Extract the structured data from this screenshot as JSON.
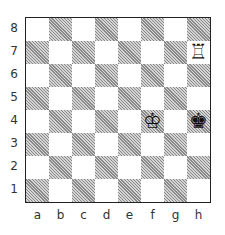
{
  "board": {
    "ranks": [
      "8",
      "7",
      "6",
      "5",
      "4",
      "3",
      "2",
      "1"
    ],
    "files": [
      "a",
      "b",
      "c",
      "d",
      "e",
      "f",
      "g",
      "h"
    ],
    "pieces": [
      {
        "square": "h7",
        "piece": "white-rook",
        "glyph": "♖"
      },
      {
        "square": "f4",
        "piece": "white-king",
        "glyph": "♔"
      },
      {
        "square": "h4",
        "piece": "black-king",
        "glyph": "♚"
      }
    ]
  }
}
